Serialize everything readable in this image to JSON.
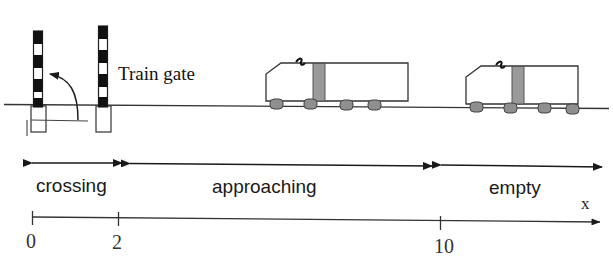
{
  "figure": {
    "title_label": "Train gate",
    "axis_label": "x"
  },
  "regions": [
    {
      "name": "crossing",
      "label": "crossing",
      "from": 0,
      "to": 2
    },
    {
      "name": "approaching",
      "label": "approaching",
      "from": 2,
      "to": 10
    },
    {
      "name": "empty",
      "label": "empty",
      "from": 10,
      "to": null
    }
  ],
  "axis": {
    "ticks": [
      {
        "value": "0",
        "x": 32
      },
      {
        "value": "2",
        "x": 118
      },
      {
        "value": "10",
        "x": 440
      }
    ],
    "arrow_label": "x"
  },
  "gates": [
    {
      "name": "gate-left",
      "state": "rotating"
    },
    {
      "name": "gate-right",
      "state": "upright"
    }
  ],
  "trains": [
    {
      "name": "train-approaching",
      "position_region": "approaching"
    },
    {
      "name": "train-empty",
      "position_region": "empty"
    }
  ],
  "colors": {
    "stroke": "#1a1a1a",
    "gate_stripe_dark": "#111111",
    "gate_stripe_light": "#ffffff",
    "train_body": "#ffffff",
    "train_divider": "#9a9a9a",
    "wheel": "#8f8f8f",
    "ground": "#333333"
  }
}
